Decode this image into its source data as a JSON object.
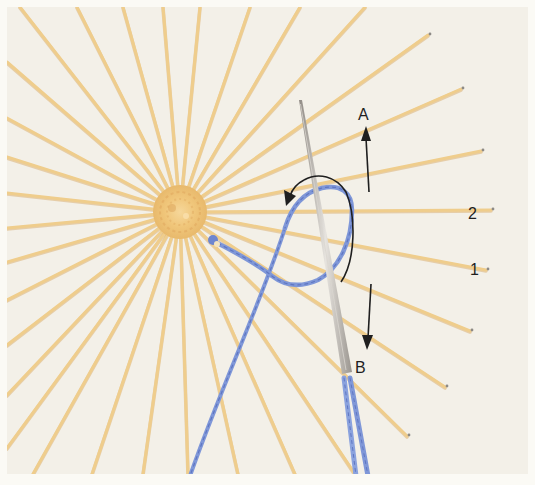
{
  "figure": {
    "colors": {
      "border": "#fbfaf5",
      "fabric": "#f3f0e8",
      "spoke": "#efcd8c",
      "spoke_shadow": "#dcb274",
      "center_knot": "#f0c67a",
      "center_shadow": "#d9a15a",
      "blue_thread": "#7f97d8",
      "blue_thread_dark": "#5f76c2",
      "needle": "#b3aea8",
      "needle_highlight": "#e6e3de",
      "annotation": "#1f1f1f"
    },
    "center": {
      "x": 180,
      "y": 212,
      "knot_radius": 26
    },
    "spoke_ends": [
      [
        20,
        7
      ],
      [
        77,
        7
      ],
      [
        123,
        7
      ],
      [
        163,
        7
      ],
      [
        200,
        7
      ],
      [
        250,
        7
      ],
      [
        300,
        7
      ],
      [
        365,
        7
      ],
      [
        428,
        35
      ],
      [
        461,
        89
      ],
      [
        481,
        151
      ],
      [
        491,
        210
      ],
      [
        486,
        270
      ],
      [
        470,
        331
      ],
      [
        445,
        387
      ],
      [
        407,
        436
      ],
      [
        355,
        474
      ],
      [
        295,
        474
      ],
      [
        238,
        474
      ],
      [
        188,
        474
      ],
      [
        143,
        474
      ],
      [
        92,
        474
      ],
      [
        33,
        474
      ],
      [
        7,
        448
      ],
      [
        7,
        395
      ],
      [
        7,
        345
      ],
      [
        7,
        300
      ],
      [
        7,
        262
      ],
      [
        7,
        228
      ],
      [
        7,
        193
      ],
      [
        7,
        157
      ],
      [
        7,
        118
      ],
      [
        7,
        62
      ]
    ],
    "labels": {
      "a": "A",
      "b": "B",
      "spoke_1": "1",
      "spoke_2": "2"
    }
  }
}
